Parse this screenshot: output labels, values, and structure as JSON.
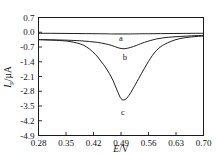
{
  "chart_data": {
    "type": "line",
    "title": "",
    "xlabel": "E/V",
    "ylabel": "Ip/µA",
    "xlabel_italic_part": "E",
    "xlabel_rest": "/V",
    "ylabel_italic_part": "I",
    "ylabel_sub": "p",
    "ylabel_rest": "/µA",
    "xlim": [
      0.28,
      0.7
    ],
    "ylim": [
      -4.9,
      0.7
    ],
    "grid": false,
    "legend_position": "inline-annotations",
    "xticks": [
      0.28,
      0.35,
      0.42,
      0.49,
      0.56,
      0.63,
      0.7
    ],
    "xtick_labels": [
      "0.28",
      "0.35",
      "0.42",
      "0.49",
      "0.56",
      "0.63",
      "0.70"
    ],
    "yticks": [
      0.7,
      0.0,
      -0.7,
      -1.4,
      -2.1,
      -2.8,
      -3.5,
      -4.2,
      -4.9
    ],
    "ytick_labels": [
      "0.7",
      "0.0",
      "-0.7",
      "-1.4",
      "-2.1",
      "-2.8",
      "-3.5",
      "-4.2",
      "-4.9"
    ],
    "annotations": [
      {
        "text": "a",
        "x": 0.49,
        "y": -0.02
      },
      {
        "text": "b",
        "x": 0.5,
        "y": -0.95
      },
      {
        "text": "c",
        "x": 0.495,
        "y": -3.55
      }
    ],
    "series": [
      {
        "name": "a",
        "label": "a",
        "peak_potential": 0.49,
        "peak_current": -0.08,
        "x": [
          0.28,
          0.31,
          0.34,
          0.37,
          0.4,
          0.43,
          0.455,
          0.47,
          0.49,
          0.51,
          0.53,
          0.56,
          0.59,
          0.62,
          0.65,
          0.68,
          0.7
        ],
        "values": [
          -0.05,
          -0.05,
          -0.055,
          -0.06,
          -0.065,
          -0.07,
          -0.075,
          -0.08,
          -0.08,
          -0.08,
          -0.075,
          -0.07,
          -0.065,
          -0.06,
          -0.055,
          -0.05,
          -0.05
        ]
      },
      {
        "name": "b",
        "label": "b",
        "peak_potential": 0.49,
        "peak_current": -0.78,
        "x": [
          0.28,
          0.31,
          0.34,
          0.37,
          0.39,
          0.41,
          0.43,
          0.45,
          0.465,
          0.48,
          0.49,
          0.5,
          0.515,
          0.53,
          0.55,
          0.58,
          0.61,
          0.64,
          0.67,
          0.7
        ],
        "values": [
          -0.35,
          -0.36,
          -0.37,
          -0.39,
          -0.41,
          -0.44,
          -0.48,
          -0.55,
          -0.62,
          -0.72,
          -0.77,
          -0.78,
          -0.72,
          -0.62,
          -0.48,
          -0.32,
          -0.24,
          -0.2,
          -0.17,
          -0.15
        ]
      },
      {
        "name": "c",
        "label": "c",
        "peak_potential": 0.49,
        "peak_current": -3.2,
        "x": [
          0.28,
          0.31,
          0.34,
          0.36,
          0.38,
          0.395,
          0.41,
          0.425,
          0.44,
          0.45,
          0.46,
          0.47,
          0.48,
          0.49,
          0.5,
          0.51,
          0.52,
          0.535,
          0.55,
          0.57,
          0.59,
          0.615,
          0.64,
          0.67,
          0.7
        ],
        "values": [
          -0.35,
          -0.37,
          -0.4,
          -0.44,
          -0.52,
          -0.62,
          -0.8,
          -1.05,
          -1.4,
          -1.65,
          -1.95,
          -2.3,
          -2.75,
          -3.15,
          -3.2,
          -3.0,
          -2.7,
          -2.2,
          -1.7,
          -1.1,
          -0.7,
          -0.45,
          -0.3,
          -0.22,
          -0.18
        ]
      }
    ]
  }
}
